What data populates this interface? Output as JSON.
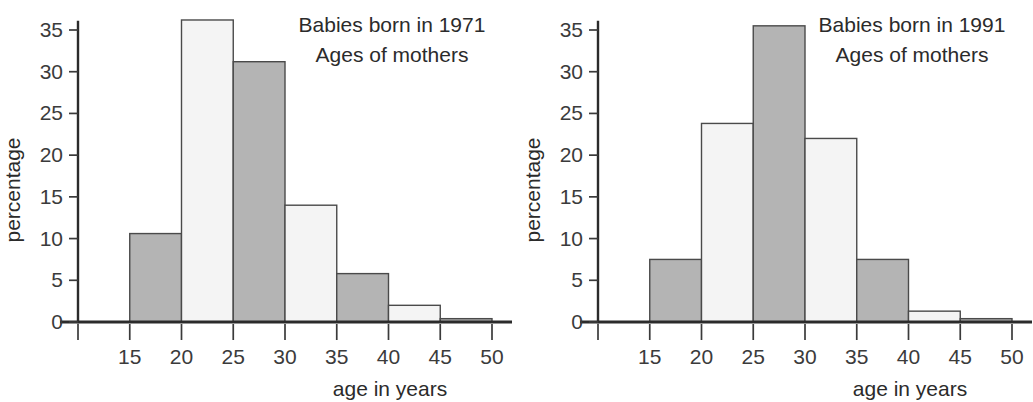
{
  "figure": {
    "panel_count": 2,
    "background_color": "#ffffff",
    "bar_dark_color": "#b4b4b4",
    "bar_light_color": "#f4f4f4",
    "bar_outline_color": "#4a4a4a",
    "axis_color": "#2b2b2b"
  },
  "panels": [
    {
      "id": "1971",
      "title_line1": "Babies born in 1971",
      "title_line2": "Ages of mothers",
      "ylabel": "percentage",
      "xlabel": "age in years",
      "ytick_labels": [
        "0",
        "5",
        "10",
        "15",
        "20",
        "25",
        "30",
        "35"
      ],
      "xtick_labels": [
        "15",
        "20",
        "25",
        "30",
        "35",
        "40",
        "45",
        "50"
      ],
      "bar_fills": [
        "dark",
        "light",
        "dark",
        "light",
        "dark",
        "light",
        "dark"
      ]
    },
    {
      "id": "1991",
      "title_line1": "Babies born in 1991",
      "title_line2": "Ages of mothers",
      "ylabel": "percentage",
      "xlabel": "age in years",
      "ytick_labels": [
        "0",
        "5",
        "10",
        "15",
        "20",
        "25",
        "30",
        "35"
      ],
      "xtick_labels": [
        "15",
        "20",
        "25",
        "30",
        "35",
        "40",
        "45",
        "50"
      ],
      "bar_fills": [
        "dark",
        "light",
        "dark",
        "light",
        "dark",
        "light",
        "dark"
      ]
    }
  ],
  "chart_data": [
    {
      "type": "bar",
      "title": "Babies born in 1971 Ages of mothers",
      "xlabel": "age in years",
      "ylabel": "percentage",
      "categories": [
        "15-20",
        "20-25",
        "25-30",
        "30-35",
        "35-40",
        "40-45",
        "45-50"
      ],
      "bin_edges": [
        15,
        20,
        25,
        30,
        35,
        40,
        45,
        50
      ],
      "values": [
        10.6,
        36.2,
        31.2,
        14.0,
        5.8,
        2.0,
        0.4
      ],
      "xlim": [
        10,
        50
      ],
      "ylim": [
        0,
        37
      ],
      "yticks": [
        0,
        5,
        10,
        15,
        20,
        25,
        30,
        35
      ],
      "xticks": [
        10,
        15,
        20,
        25,
        30,
        35,
        40,
        45,
        50
      ],
      "xtick_labels": [
        "",
        "15",
        "20",
        "25",
        "30",
        "35",
        "40",
        "45",
        "50"
      ],
      "grid": false,
      "legend": false
    },
    {
      "type": "bar",
      "title": "Babies born in 1991 Ages of mothers",
      "xlabel": "age in years",
      "ylabel": "percentage",
      "categories": [
        "15-20",
        "20-25",
        "25-30",
        "30-35",
        "35-40",
        "40-45",
        "45-50"
      ],
      "bin_edges": [
        15,
        20,
        25,
        30,
        35,
        40,
        45,
        50
      ],
      "values": [
        7.5,
        23.8,
        35.5,
        22.0,
        7.5,
        1.3,
        0.4
      ],
      "xlim": [
        10,
        50
      ],
      "ylim": [
        0,
        37
      ],
      "yticks": [
        0,
        5,
        10,
        15,
        20,
        25,
        30,
        35
      ],
      "xticks": [
        10,
        15,
        20,
        25,
        30,
        35,
        40,
        45,
        50
      ],
      "xtick_labels": [
        "",
        "15",
        "20",
        "25",
        "30",
        "35",
        "40",
        "45",
        "50"
      ],
      "grid": false,
      "legend": false
    }
  ]
}
